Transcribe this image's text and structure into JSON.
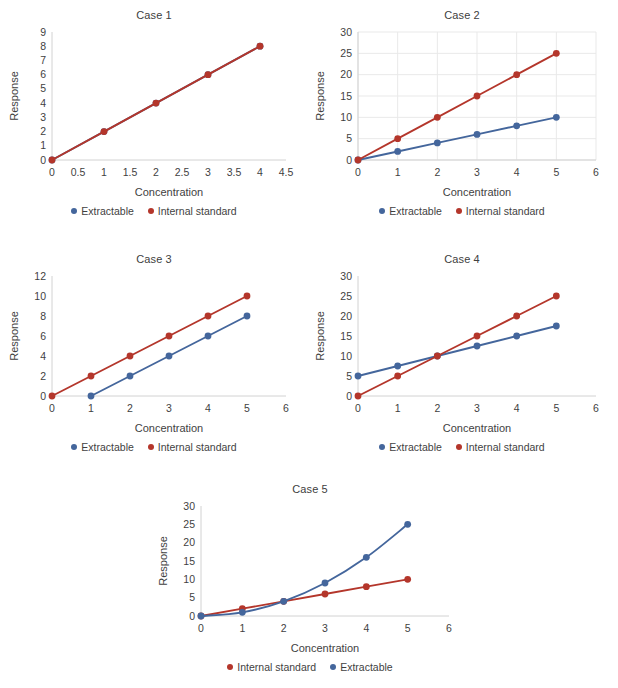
{
  "figure": {
    "background": "#ffffff",
    "series_colors": {
      "extractable": "#44669c",
      "internal_standard": "#b4362b"
    },
    "legend_labels": {
      "extractable": "Extractable",
      "internal_standard": "Internal standard"
    },
    "axis_titles": {
      "x": "Concentration",
      "y": "Response"
    }
  },
  "chart_data": [
    {
      "type": "line",
      "title": "Case 1",
      "xlabel": "Concentration",
      "ylabel": "Response",
      "xlim": [
        0,
        4.5
      ],
      "ylim": [
        0,
        9
      ],
      "xticks": [
        "0",
        "0.5",
        "1",
        "1.5",
        "2",
        "2.5",
        "3",
        "3.5",
        "4",
        "4.5"
      ],
      "xtick_values": [
        0,
        0.5,
        1,
        1.5,
        2,
        2.5,
        3,
        3.5,
        4,
        4.5
      ],
      "yticks": [
        "0",
        "1",
        "2",
        "3",
        "4",
        "5",
        "6",
        "7",
        "8",
        "9"
      ],
      "ytick_values": [
        0,
        1,
        2,
        3,
        4,
        5,
        6,
        7,
        8,
        9
      ],
      "grid": false,
      "legend_position": "bottom",
      "legend_order": [
        "Extractable",
        "Internal standard"
      ],
      "series": [
        {
          "name": "Extractable",
          "color": "#44669c",
          "x": [
            0,
            1,
            2,
            3,
            4
          ],
          "values": [
            0,
            2,
            4,
            6,
            8
          ],
          "hidden_behind": true
        },
        {
          "name": "Internal standard",
          "color": "#b4362b",
          "x": [
            0,
            1,
            2,
            3,
            4
          ],
          "values": [
            0,
            2,
            4,
            6,
            8
          ]
        }
      ]
    },
    {
      "type": "line",
      "title": "Case 2",
      "xlabel": "Concentration",
      "ylabel": "Response",
      "xlim": [
        0,
        6
      ],
      "ylim": [
        0,
        30
      ],
      "xticks": [
        "0",
        "1",
        "2",
        "3",
        "4",
        "5",
        "6"
      ],
      "xtick_values": [
        0,
        1,
        2,
        3,
        4,
        5,
        6
      ],
      "yticks": [
        "0",
        "5",
        "10",
        "15",
        "20",
        "25",
        "30"
      ],
      "ytick_values": [
        0,
        5,
        10,
        15,
        20,
        25,
        30
      ],
      "grid": true,
      "legend_position": "bottom",
      "legend_order": [
        "Extractable",
        "Internal standard"
      ],
      "series": [
        {
          "name": "Extractable",
          "color": "#44669c",
          "x": [
            0,
            1,
            2,
            3,
            4,
            5
          ],
          "values": [
            0,
            2,
            4,
            6,
            8,
            10
          ]
        },
        {
          "name": "Internal standard",
          "color": "#b4362b",
          "x": [
            0,
            1,
            2,
            3,
            4,
            5
          ],
          "values": [
            0,
            5,
            10,
            15,
            20,
            25
          ]
        }
      ]
    },
    {
      "type": "line",
      "title": "Case 3",
      "xlabel": "Concentration",
      "ylabel": "Response",
      "xlim": [
        0,
        6
      ],
      "ylim": [
        0,
        12
      ],
      "xticks": [
        "0",
        "1",
        "2",
        "3",
        "4",
        "5",
        "6"
      ],
      "xtick_values": [
        0,
        1,
        2,
        3,
        4,
        5,
        6
      ],
      "yticks": [
        "0",
        "2",
        "4",
        "6",
        "8",
        "10",
        "12"
      ],
      "ytick_values": [
        0,
        2,
        4,
        6,
        8,
        10,
        12
      ],
      "grid": false,
      "legend_position": "bottom",
      "legend_order": [
        "Extractable",
        "Internal standard"
      ],
      "series": [
        {
          "name": "Extractable",
          "color": "#44669c",
          "x": [
            1,
            2,
            3,
            4,
            5
          ],
          "values": [
            0,
            2,
            4,
            6,
            8
          ]
        },
        {
          "name": "Internal standard",
          "color": "#b4362b",
          "x": [
            0,
            1,
            2,
            3,
            4,
            5
          ],
          "values": [
            0,
            2,
            4,
            6,
            8,
            10
          ]
        }
      ]
    },
    {
      "type": "line",
      "title": "Case 4",
      "xlabel": "Concentration",
      "ylabel": "Response",
      "xlim": [
        0,
        6
      ],
      "ylim": [
        0,
        30
      ],
      "xticks": [
        "0",
        "1",
        "2",
        "3",
        "4",
        "5",
        "6"
      ],
      "xtick_values": [
        0,
        1,
        2,
        3,
        4,
        5,
        6
      ],
      "yticks": [
        "0",
        "5",
        "10",
        "15",
        "20",
        "25",
        "30"
      ],
      "ytick_values": [
        0,
        5,
        10,
        15,
        20,
        25,
        30
      ],
      "grid": false,
      "legend_position": "bottom",
      "legend_order": [
        "Extractable",
        "Internal standard"
      ],
      "series": [
        {
          "name": "Extractable",
          "color": "#44669c",
          "x": [
            0,
            1,
            2,
            3,
            4,
            5
          ],
          "values": [
            5,
            7.5,
            10,
            12.5,
            15,
            17.5
          ]
        },
        {
          "name": "Internal standard",
          "color": "#b4362b",
          "x": [
            0,
            1,
            2,
            3,
            4,
            5
          ],
          "values": [
            0,
            5,
            10,
            15,
            20,
            25
          ]
        }
      ]
    },
    {
      "type": "line",
      "title": "Case 5",
      "xlabel": "Concentration",
      "ylabel": "Response",
      "xlim": [
        0,
        6
      ],
      "ylim": [
        0,
        30
      ],
      "xticks": [
        "0",
        "1",
        "2",
        "3",
        "4",
        "5",
        "6"
      ],
      "xtick_values": [
        0,
        1,
        2,
        3,
        4,
        5,
        6
      ],
      "yticks": [
        "0",
        "5",
        "10",
        "15",
        "20",
        "25",
        "30"
      ],
      "ytick_values": [
        0,
        5,
        10,
        15,
        20,
        25,
        30
      ],
      "grid": false,
      "smooth": true,
      "legend_position": "bottom",
      "legend_order": [
        "Internal standard",
        "Extractable"
      ],
      "series": [
        {
          "name": "Internal standard",
          "color": "#b4362b",
          "x": [
            0,
            1,
            2,
            3,
            4,
            5
          ],
          "values": [
            0,
            2,
            4,
            6,
            8,
            10
          ]
        },
        {
          "name": "Extractable",
          "color": "#44669c",
          "x": [
            0,
            1,
            2,
            3,
            4,
            5
          ],
          "values": [
            0,
            1,
            4,
            9,
            16,
            25
          ],
          "smooth": true
        }
      ]
    }
  ]
}
